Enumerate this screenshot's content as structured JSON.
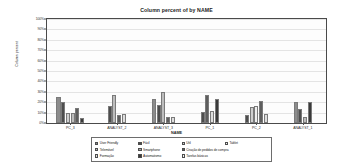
{
  "chart_data": {
    "type": "bar",
    "title": "Column percent of  by NAME",
    "xlabel": "NAME",
    "ylabel": "Column percent",
    "ylim": [
      0,
      100
    ],
    "yticks": [
      "0%",
      "10%",
      "20%",
      "30%",
      "40%",
      "50%",
      "60%",
      "70%",
      "80%",
      "90%",
      "100%"
    ],
    "grid": true,
    "legend_position": "bottom",
    "categories": [
      "PC_3",
      "ANALYST_2",
      "ANALYST_3",
      "PC_1",
      "PC_2",
      "ANALYST_1"
    ],
    "series": [
      {
        "name": "User Friendly",
        "color": "#8c8c8c",
        "values": [
          25,
          0,
          23,
          0,
          0,
          20
        ]
      },
      {
        "name": "Fácil",
        "color": "#4d4d4d",
        "values": [
          20,
          16,
          17,
          11,
          8,
          13
        ]
      },
      {
        "name": "Útil",
        "color": "#cfcfcf",
        "values": [
          10,
          0,
          0,
          0,
          15,
          0
        ]
      },
      {
        "name": "Tablet",
        "color": "#efefef",
        "values": [
          0,
          0,
          0,
          0,
          16,
          0
        ]
      },
      {
        "name": "Telemóvel",
        "color": "#bdbdbd",
        "values": [
          10,
          27,
          30,
          0,
          0,
          6
        ]
      },
      {
        "name": "Smartphone",
        "color": "#a8a8a8",
        "values": [
          0,
          0,
          0,
          0,
          0,
          0
        ]
      },
      {
        "name": "Criação de pedidos de compra",
        "color": "#5e5e5e",
        "values": [
          14,
          8,
          6,
          27,
          21,
          0
        ]
      },
      {
        "name": "Formação",
        "color": "#dedede",
        "values": [
          0,
          9,
          6,
          12,
          9,
          0
        ]
      },
      {
        "name": "Automatismo",
        "color": "#3a3a3a",
        "values": [
          5,
          0,
          0,
          23,
          0,
          20
        ]
      },
      {
        "name": "Tarefas básicas",
        "color": "#f2f2f2",
        "values": [
          0,
          0,
          0,
          0,
          0,
          0
        ]
      }
    ]
  },
  "legend": {
    "items": [
      {
        "label": "User Friendly",
        "color": "#8c8c8c"
      },
      {
        "label": "Fácil",
        "color": "#4d4d4d"
      },
      {
        "label": "Útil",
        "color": "#cfcfcf"
      },
      {
        "label": "Tablet",
        "color": "#efefef"
      },
      {
        "label": "Telemóvel",
        "color": "#bdbdbd"
      },
      {
        "label": "Smartphone",
        "color": "#a8a8a8"
      },
      {
        "label": "Criação de pedidos de compra",
        "color": "#5e5e5e"
      },
      {
        "label": "Formação",
        "color": "#dedede"
      },
      {
        "label": "Automatismo",
        "color": "#3a3a3a"
      },
      {
        "label": "Tarefas básicas",
        "color": "#f2f2f2"
      }
    ]
  }
}
